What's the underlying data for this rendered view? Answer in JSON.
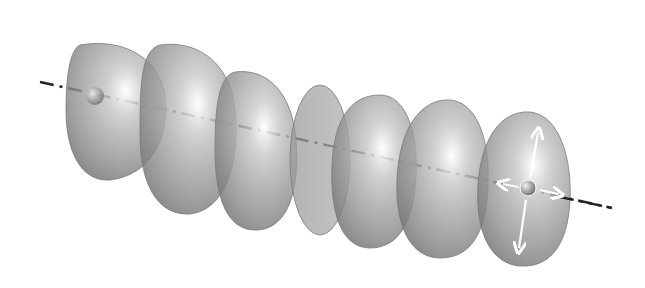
{
  "figure": {
    "colors": {
      "background": "#ffffff",
      "slice_fill": "#8a8a8a",
      "slice_edge": "#6d6d6d",
      "highlight": "#ffffff",
      "axis": "#222222",
      "arrow": "#ffffff"
    },
    "slices": [
      {
        "cx": 112,
        "cy": 112,
        "rx": 52,
        "ry": 70,
        "hx": 128,
        "hy": 88
      },
      {
        "cx": 185,
        "cy": 132,
        "rx": 48,
        "ry": 78,
        "hx": 200,
        "hy": 100
      },
      {
        "cx": 255,
        "cy": 150,
        "rx": 42,
        "ry": 78,
        "hx": 265,
        "hy": 118
      },
      {
        "cx": 320,
        "cy": 160,
        "rx": 32,
        "ry": 75,
        "hx": 325,
        "hy": 140
      },
      {
        "cx": 375,
        "cy": 170,
        "rx": 42,
        "ry": 78,
        "hx": 385,
        "hy": 140
      },
      {
        "cx": 440,
        "cy": 180,
        "rx": 45,
        "ry": 80,
        "hx": 455,
        "hy": 150
      },
      {
        "cx": 520,
        "cy": 190,
        "rx": 52,
        "ry": 78,
        "hx": 535,
        "hy": 160
      }
    ],
    "axis": {
      "x1": 40,
      "y1": 82,
      "x2": 612,
      "y2": 208
    },
    "origin_marker": {
      "x": 95,
      "y": 96
    },
    "end_marker": {
      "x": 528,
      "y": 188
    }
  }
}
